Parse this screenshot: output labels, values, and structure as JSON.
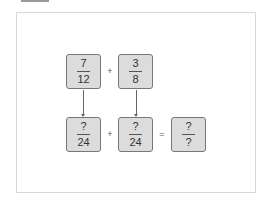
{
  "diagram": {
    "top_row": [
      {
        "numerator": "7",
        "denominator": "12"
      },
      {
        "numerator": "3",
        "denominator": "8"
      }
    ],
    "top_operator": "+",
    "bottom_row": [
      {
        "numerator": "?",
        "denominator": "24"
      },
      {
        "numerator": "?",
        "denominator": "24"
      }
    ],
    "bottom_operator": "+",
    "equals": "=",
    "result": {
      "numerator": "?",
      "denominator": "?"
    }
  }
}
